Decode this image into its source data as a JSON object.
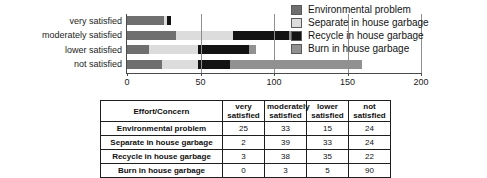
{
  "chart_data": {
    "type": "bar",
    "orientation": "horizontal",
    "stacked": true,
    "title": "",
    "xlabel": "",
    "ylabel": "",
    "xlim": [
      0,
      200
    ],
    "xticks": [
      0,
      50,
      100,
      150,
      200
    ],
    "xtick_labels": [
      "0",
      "50",
      "100",
      "150",
      "200"
    ],
    "grid": true,
    "legend_position": "top-right",
    "categories": [
      "very satisfied",
      "moderately satisfied",
      "lower satisfied",
      "not satisfied"
    ],
    "series": [
      {
        "name": "Environmental problem",
        "color": "#6f6f6f",
        "values": [
          25,
          33,
          15,
          24
        ]
      },
      {
        "name": "Separate in house garbage",
        "color": "#dcdcdc",
        "values": [
          2,
          39,
          33,
          24
        ]
      },
      {
        "name": "Recycle in house garbage",
        "color": "#131313",
        "values": [
          3,
          38,
          35,
          22
        ]
      },
      {
        "name": "Burn in house garbage",
        "color": "#919191",
        "values": [
          0,
          3,
          5,
          90
        ]
      }
    ],
    "totals": [
      30,
      113,
      88,
      160
    ]
  },
  "legend": {
    "items": [
      {
        "label": "Environmental problem",
        "color": "#6f6f6f"
      },
      {
        "label": "Separate in house garbage",
        "color": "#dcdcdc"
      },
      {
        "label": "Recycle in house garbage",
        "color": "#131313"
      },
      {
        "label": "Burn in house garbage",
        "color": "#919191"
      }
    ]
  },
  "table": {
    "corner_header": "Effort/Concern",
    "column_headers": [
      {
        "line1": "very",
        "line2": "satisfied"
      },
      {
        "line1": "moderately",
        "line2": "satisfied"
      },
      {
        "line1": "lower",
        "line2": "satisfied"
      },
      {
        "line1": "not",
        "line2": "satisfied"
      }
    ],
    "rows": [
      {
        "label": "Environmental problem",
        "values": [
          "25",
          "33",
          "15",
          "24"
        ]
      },
      {
        "label": "Separate in house garbage",
        "values": [
          "2",
          "39",
          "33",
          "24"
        ]
      },
      {
        "label": "Recycle in house garbage",
        "values": [
          "3",
          "38",
          "35",
          "22"
        ]
      },
      {
        "label": "Burn in house garbage",
        "values": [
          "0",
          "3",
          "5",
          "90"
        ]
      }
    ]
  }
}
